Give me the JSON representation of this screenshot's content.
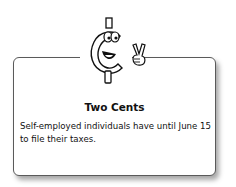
{
  "sidebar_box": {
    "title": "Two Cents",
    "body": "Self-employed individuals have until June 15 to file their taxes.",
    "icon": "cent-sign-mascot-peace-icon"
  }
}
